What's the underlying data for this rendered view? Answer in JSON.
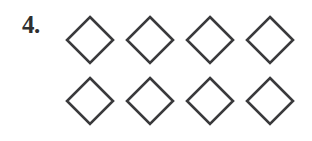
{
  "item": {
    "number_label": "4.",
    "shape_name": "diamond",
    "shape_count": 8,
    "rows": 2,
    "columns": 4,
    "stroke_color": "#3a3a3c",
    "fill_color": "#ffffff",
    "background_color": "#ffffff",
    "number_color": "#2f2f2f"
  },
  "shapes": [
    {
      "id": "shape-1",
      "row": 1,
      "column": 1,
      "name": "diamond"
    },
    {
      "id": "shape-2",
      "row": 1,
      "column": 2,
      "name": "diamond"
    },
    {
      "id": "shape-3",
      "row": 1,
      "column": 3,
      "name": "diamond"
    },
    {
      "id": "shape-4",
      "row": 1,
      "column": 4,
      "name": "diamond"
    },
    {
      "id": "shape-5",
      "row": 2,
      "column": 1,
      "name": "diamond"
    },
    {
      "id": "shape-6",
      "row": 2,
      "column": 2,
      "name": "diamond"
    },
    {
      "id": "shape-7",
      "row": 2,
      "column": 3,
      "name": "diamond"
    },
    {
      "id": "shape-8",
      "row": 2,
      "column": 4,
      "name": "diamond"
    }
  ]
}
